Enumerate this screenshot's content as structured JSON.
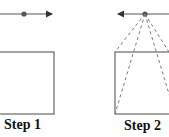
{
  "steps": [
    {
      "label": "Step 1"
    },
    {
      "label": "Step 2"
    }
  ],
  "colors": {
    "line": "#555555",
    "dot": "#555555",
    "rect": "#666666",
    "text": "#111111"
  }
}
